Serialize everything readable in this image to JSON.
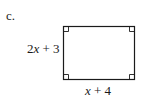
{
  "problem": {
    "part_label": "c.",
    "shape": "rectangle",
    "left_side_label": "2x + 3",
    "bottom_side_label": "x + 4",
    "right_angle_markers": 4
  },
  "colors": {
    "stroke": "#1a1a1a",
    "background": "#ffffff"
  }
}
